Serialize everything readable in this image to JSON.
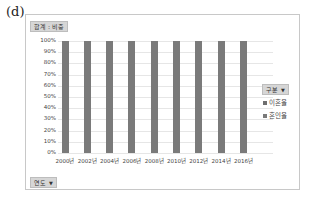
{
  "panel_label": "(d)",
  "value_field": "합계 : 비중",
  "row_field": "연도",
  "legend_field": "구분",
  "colors": {
    "이혼율": "#6e6e6e",
    "혼인율": "#7a7a7a",
    "grid": "#e6e6e6"
  },
  "chart_data": {
    "type": "bar",
    "stacked": true,
    "percent_stacked": true,
    "title": "",
    "xlabel": "",
    "ylabel": "",
    "categories": [
      "2000년",
      "2002년",
      "2004년",
      "2006년",
      "2008년",
      "2010년",
      "2012년",
      "2014년",
      "2016년"
    ],
    "series": [
      {
        "name": "이혼율",
        "values": [
          0,
          0,
          0,
          0,
          0,
          0,
          0,
          0,
          0
        ]
      },
      {
        "name": "혼인율",
        "values": [
          100,
          100,
          100,
          100,
          100,
          100,
          100,
          100,
          100
        ]
      }
    ],
    "yticks": [
      "0%",
      "10%",
      "20%",
      "30%",
      "40%",
      "50%",
      "60%",
      "70%",
      "80%",
      "90%",
      "100%"
    ],
    "ylim": [
      0,
      100
    ],
    "grid": true,
    "legend_position": "right",
    "legend": [
      "이혼율",
      "혼인율"
    ]
  }
}
